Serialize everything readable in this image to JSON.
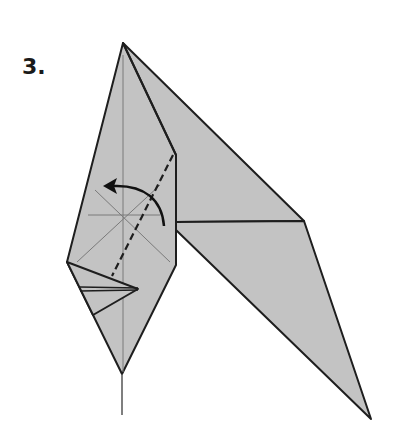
{
  "step": {
    "number_label": "3."
  },
  "colors": {
    "paper_fill": "#c3c3c3",
    "outline": "#1e1e1e",
    "crease": "#7a7a7a",
    "arrow": "#111111",
    "background": "#ffffff"
  },
  "diagram": {
    "symbols": [
      "valley-fold-line",
      "fold-arrow",
      "crease-lines",
      "stem"
    ]
  }
}
